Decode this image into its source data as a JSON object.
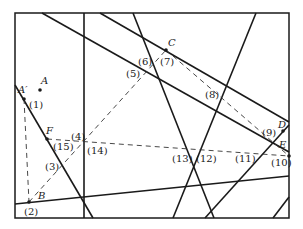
{
  "diagram": {
    "frame": {
      "x1": 15,
      "y1": 13,
      "x2": 289,
      "y2": 218
    },
    "points": [
      {
        "name": "A",
        "label": "A",
        "x": 40,
        "y": 90,
        "lx": 41,
        "ly": 84
      },
      {
        "name": "A'",
        "label": "A′",
        "x": 24,
        "y": 99,
        "lx": 18,
        "ly": 93
      },
      {
        "name": "B",
        "label": "B",
        "x": 29,
        "y": 202,
        "lx": 38,
        "ly": 199
      },
      {
        "name": "C",
        "label": "C",
        "x": 166,
        "y": 50,
        "lx": 168,
        "ly": 46
      },
      {
        "name": "D",
        "label": "D",
        "x": 283,
        "y": 131,
        "lx": 278,
        "ly": 128
      },
      {
        "name": "E",
        "label": "E",
        "x": 289,
        "y": 156,
        "lx": 279,
        "ly": 148
      },
      {
        "name": "F",
        "label": "F",
        "x": 47,
        "y": 139,
        "lx": 46,
        "ly": 134
      }
    ],
    "segment_labels": [
      {
        "id": "1",
        "text": "(1)",
        "x": 29,
        "y": 108
      },
      {
        "id": "2",
        "text": "(2)",
        "x": 24,
        "y": 215
      },
      {
        "id": "3",
        "text": "(3)",
        "x": 45,
        "y": 170
      },
      {
        "id": "4",
        "text": "(4)",
        "x": 71,
        "y": 140
      },
      {
        "id": "5",
        "text": "(5)",
        "x": 126,
        "y": 77
      },
      {
        "id": "6",
        "text": "(6)",
        "x": 138,
        "y": 65
      },
      {
        "id": "7",
        "text": "(7)",
        "x": 160,
        "y": 65
      },
      {
        "id": "8",
        "text": "(8)",
        "x": 205,
        "y": 98
      },
      {
        "id": "9",
        "text": "(9)",
        "x": 262,
        "y": 136
      },
      {
        "id": "10",
        "text": "(10)",
        "x": 271,
        "y": 166
      },
      {
        "id": "11",
        "text": "(11)",
        "x": 235,
        "y": 162
      },
      {
        "id": "12",
        "text": "(12)",
        "x": 196,
        "y": 162
      },
      {
        "id": "13",
        "text": "(13)",
        "x": 172,
        "y": 162
      },
      {
        "id": "14",
        "text": "(14)",
        "x": 87,
        "y": 154
      },
      {
        "id": "15",
        "text": "(15)",
        "x": 53,
        "y": 150
      }
    ],
    "solid_lines": [
      {
        "id": "vertical",
        "x1": 84,
        "y1": 13,
        "x2": 84,
        "y2": 218
      },
      {
        "id": "diag-top-left",
        "x1": 42,
        "y1": 13,
        "x2": 289,
        "y2": 152
      },
      {
        "id": "diag-through-C",
        "x1": 100,
        "y1": 13,
        "x2": 289,
        "y2": 122
      },
      {
        "id": "steep-6-13",
        "x1": 133,
        "y1": 13,
        "x2": 214,
        "y2": 218
      },
      {
        "id": "steep-8-12",
        "x1": 256,
        "y1": 13,
        "x2": 173,
        "y2": 218
      },
      {
        "id": "line-A-prime",
        "x1": 15,
        "y1": 85,
        "x2": 93,
        "y2": 218
      },
      {
        "id": "near-horizontal",
        "x1": 15,
        "y1": 204,
        "x2": 289,
        "y2": 176
      },
      {
        "id": "line-9-11",
        "x1": 289,
        "y1": 125,
        "x2": 205,
        "y2": 218
      },
      {
        "id": "corner-br",
        "x1": 289,
        "y1": 197,
        "x2": 273,
        "y2": 218
      }
    ],
    "dashed_lines": [
      {
        "id": "A-prime-to-B",
        "x1": 24,
        "y1": 99,
        "x2": 29,
        "y2": 202
      },
      {
        "id": "B-to-C",
        "x1": 29,
        "y1": 202,
        "x2": 166,
        "y2": 50
      },
      {
        "id": "C-to-E",
        "x1": 166,
        "y1": 50,
        "x2": 289,
        "y2": 156
      },
      {
        "id": "F-to-E",
        "x1": 47,
        "y1": 139,
        "x2": 289,
        "y2": 156
      }
    ]
  }
}
